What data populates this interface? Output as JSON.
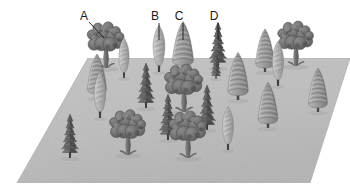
{
  "figure": {
    "background_color": "#ffffff"
  },
  "ground": {
    "name": "forest-plot-ground",
    "shape": "parallelogram",
    "fill_color": "#bdbdbd",
    "edge_color": "#b0b0b0",
    "shadow_color": "#d8d8d8",
    "corners": [
      {
        "x": 88,
        "y": 58
      },
      {
        "x": 350,
        "y": 58
      },
      {
        "x": 310,
        "y": 183
      },
      {
        "x": 17,
        "y": 183
      }
    ]
  },
  "labels": [
    {
      "id": "A",
      "text": "A",
      "species": "broadleaf-deciduous",
      "label_x": 84,
      "label_y": 20,
      "leader": {
        "type": "diagonal",
        "x1": 89,
        "y1": 22,
        "x2": 104,
        "y2": 38
      }
    },
    {
      "id": "B",
      "text": "B",
      "species": "narrow-columnar",
      "label_x": 155,
      "label_y": 20,
      "leader": {
        "type": "vertical",
        "x1": 159,
        "y1": 23,
        "x2": 159,
        "y2": 40
      }
    },
    {
      "id": "C",
      "text": "C",
      "species": "broad-conical-conifer",
      "label_x": 179,
      "label_y": 20,
      "leader": {
        "type": "vertical",
        "x1": 183,
        "y1": 23,
        "x2": 183,
        "y2": 40
      }
    },
    {
      "id": "D",
      "text": "D",
      "species": "spiky-tiered-conifer",
      "label_x": 214,
      "label_y": 20,
      "leader": {
        "type": "vertical",
        "x1": 218,
        "y1": 23,
        "x2": 218,
        "y2": 40
      }
    }
  ],
  "species_legend": [
    {
      "key": "A",
      "name": "broadleaf-deciduous",
      "description": "Rounded lumpy canopy on a slender trunk",
      "fill": "#6e6e6e"
    },
    {
      "key": "B",
      "name": "narrow-columnar",
      "description": "Tall slim spindle-shaped crown",
      "fill": "#b6b6b6"
    },
    {
      "key": "C",
      "name": "broad-conical-conifer",
      "description": "Wide cone with horizontal banding",
      "fill": "#9a9a9a"
    },
    {
      "key": "D",
      "name": "spiky-tiered-conifer",
      "description": "Narrow cone with layered spiky branches",
      "fill": "#5e5e5e"
    }
  ],
  "trees": [
    {
      "id": "t01",
      "species": "A",
      "x": 106,
      "y": 68,
      "scale": 1.08,
      "labelled": "A"
    },
    {
      "id": "t02",
      "species": "A",
      "x": 184,
      "y": 112,
      "scale": 1.12,
      "labelled": null
    },
    {
      "id": "t03",
      "species": "A",
      "x": 128,
      "y": 155,
      "scale": 1.06,
      "labelled": null
    },
    {
      "id": "t04",
      "species": "A",
      "x": 188,
      "y": 158,
      "scale": 1.1,
      "labelled": null
    },
    {
      "id": "t05",
      "species": "A",
      "x": 296,
      "y": 66,
      "scale": 1.05,
      "labelled": null
    },
    {
      "id": "t06",
      "species": "B",
      "x": 159,
      "y": 72,
      "scale": 1.02,
      "labelled": "B"
    },
    {
      "id": "t07",
      "species": "B",
      "x": 124,
      "y": 78,
      "scale": 0.88,
      "labelled": null
    },
    {
      "id": "t08",
      "species": "B",
      "x": 100,
      "y": 118,
      "scale": 1.0,
      "labelled": null
    },
    {
      "id": "t09",
      "species": "B",
      "x": 228,
      "y": 150,
      "scale": 0.95,
      "labelled": null
    },
    {
      "id": "t10",
      "species": "B",
      "x": 278,
      "y": 86,
      "scale": 0.98,
      "labelled": null
    },
    {
      "id": "t11",
      "species": "C",
      "x": 183,
      "y": 70,
      "scale": 1.1,
      "labelled": "C"
    },
    {
      "id": "t12",
      "species": "C",
      "x": 97,
      "y": 98,
      "scale": 1.0,
      "labelled": null
    },
    {
      "id": "t13",
      "species": "C",
      "x": 238,
      "y": 100,
      "scale": 1.08,
      "labelled": null
    },
    {
      "id": "t14",
      "species": "C",
      "x": 265,
      "y": 72,
      "scale": 0.98,
      "labelled": null
    },
    {
      "id": "t15",
      "species": "C",
      "x": 268,
      "y": 128,
      "scale": 1.04,
      "labelled": null
    },
    {
      "id": "t16",
      "species": "C",
      "x": 318,
      "y": 112,
      "scale": 1.0,
      "labelled": null
    },
    {
      "id": "t17",
      "species": "D",
      "x": 218,
      "y": 68,
      "scale": 1.02,
      "labelled": "D"
    },
    {
      "id": "t18",
      "species": "D",
      "x": 146,
      "y": 108,
      "scale": 1.0,
      "labelled": null
    },
    {
      "id": "t19",
      "species": "D",
      "x": 168,
      "y": 140,
      "scale": 1.02,
      "labelled": null
    },
    {
      "id": "t20",
      "species": "D",
      "x": 207,
      "y": 130,
      "scale": 1.0,
      "labelled": null
    },
    {
      "id": "t21",
      "species": "D",
      "x": 70,
      "y": 158,
      "scale": 0.98,
      "labelled": null
    },
    {
      "id": "t22",
      "species": "D",
      "x": 216,
      "y": 79,
      "scale": 0.6,
      "labelled": null
    }
  ]
}
